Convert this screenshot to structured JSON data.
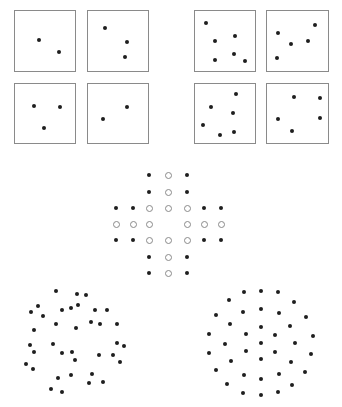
{
  "figure": {
    "colors": {
      "dot": "#1e1e1e",
      "box_border": "#8a8a8a",
      "open_circle_border": "#8a8a8a",
      "background": "#ffffff"
    },
    "boxes": [
      {
        "name": "box-top-left-1",
        "x": 14,
        "y": 10,
        "w": 62,
        "h": 62,
        "dots": [
          [
            39,
            40
          ],
          [
            59,
            52
          ]
        ]
      },
      {
        "name": "box-top-left-2",
        "x": 87,
        "y": 10,
        "w": 62,
        "h": 62,
        "dots": [
          [
            105,
            28
          ],
          [
            127,
            42
          ],
          [
            125,
            57
          ]
        ]
      },
      {
        "name": "box-top-left-3",
        "x": 14,
        "y": 83,
        "w": 62,
        "h": 61,
        "dots": [
          [
            34,
            106
          ],
          [
            60,
            107
          ],
          [
            44,
            128
          ]
        ]
      },
      {
        "name": "box-top-left-4",
        "x": 87,
        "y": 83,
        "w": 62,
        "h": 61,
        "dots": [
          [
            127,
            107
          ],
          [
            103,
            119
          ]
        ]
      },
      {
        "name": "box-top-right-1",
        "x": 194,
        "y": 10,
        "w": 62,
        "h": 62,
        "dots": [
          [
            206,
            23
          ],
          [
            215,
            41
          ],
          [
            235,
            36
          ],
          [
            215,
            60
          ],
          [
            234,
            54
          ],
          [
            245,
            61
          ]
        ]
      },
      {
        "name": "box-top-right-2",
        "x": 266,
        "y": 10,
        "w": 63,
        "h": 62,
        "dots": [
          [
            278,
            33
          ],
          [
            291,
            44
          ],
          [
            308,
            41
          ],
          [
            315,
            25
          ],
          [
            277,
            58
          ]
        ]
      },
      {
        "name": "box-top-right-3",
        "x": 194,
        "y": 83,
        "w": 62,
        "h": 61,
        "dots": [
          [
            236,
            94
          ],
          [
            211,
            107
          ],
          [
            233,
            113
          ],
          [
            203,
            125
          ],
          [
            220,
            135
          ],
          [
            234,
            132
          ]
        ]
      },
      {
        "name": "box-top-right-4",
        "x": 266,
        "y": 83,
        "w": 63,
        "h": 61,
        "dots": [
          [
            294,
            97
          ],
          [
            320,
            98
          ],
          [
            278,
            119
          ],
          [
            320,
            118
          ],
          [
            292,
            131
          ]
        ]
      }
    ],
    "grid": {
      "col_x": [
        116,
        133,
        149,
        168,
        187,
        204,
        221
      ],
      "row_y": [
        175,
        192,
        208,
        224,
        240,
        257,
        273
      ],
      "legend": {
        "f": "filled dot",
        "o": "open circle",
        "-": "empty"
      },
      "rows": [
        "--fof--",
        "--fof--",
        "ffooo ff",
        "ooo-ooo",
        "ffoooff",
        "--fof--",
        "--fof--"
      ]
    },
    "cluster_left": {
      "dots": [
        [
          56,
          291
        ],
        [
          77,
          294
        ],
        [
          86,
          295
        ],
        [
          38,
          306
        ],
        [
          31,
          312
        ],
        [
          62,
          310
        ],
        [
          71,
          308
        ],
        [
          78,
          305
        ],
        [
          95,
          310
        ],
        [
          107,
          310
        ],
        [
          43,
          316
        ],
        [
          56,
          324
        ],
        [
          76,
          328
        ],
        [
          91,
          322
        ],
        [
          100,
          324
        ],
        [
          117,
          324
        ],
        [
          34,
          330
        ],
        [
          30,
          345
        ],
        [
          53,
          344
        ],
        [
          117,
          343
        ],
        [
          124,
          346
        ],
        [
          34,
          352
        ],
        [
          62,
          353
        ],
        [
          72,
          352
        ],
        [
          75,
          360
        ],
        [
          99,
          355
        ],
        [
          113,
          355
        ],
        [
          120,
          362
        ],
        [
          26,
          364
        ],
        [
          33,
          369
        ],
        [
          71,
          375
        ],
        [
          92,
          374
        ],
        [
          58,
          378
        ],
        [
          89,
          383
        ],
        [
          103,
          382
        ],
        [
          51,
          389
        ],
        [
          62,
          392
        ]
      ]
    },
    "cluster_right": {
      "dots": [
        [
          244,
          292
        ],
        [
          261,
          291
        ],
        [
          278,
          292
        ],
        [
          229,
          300
        ],
        [
          294,
          302
        ],
        [
          243,
          312
        ],
        [
          261,
          309
        ],
        [
          279,
          313
        ],
        [
          216,
          315
        ],
        [
          306,
          317
        ],
        [
          230,
          324
        ],
        [
          261,
          327
        ],
        [
          290,
          326
        ],
        [
          209,
          334
        ],
        [
          246,
          334
        ],
        [
          275,
          335
        ],
        [
          313,
          336
        ],
        [
          225,
          344
        ],
        [
          261,
          343
        ],
        [
          295,
          343
        ],
        [
          209,
          353
        ],
        [
          246,
          351
        ],
        [
          275,
          352
        ],
        [
          311,
          354
        ],
        [
          231,
          361
        ],
        [
          261,
          359
        ],
        [
          291,
          362
        ],
        [
          216,
          370
        ],
        [
          305,
          372
        ],
        [
          244,
          375
        ],
        [
          279,
          374
        ],
        [
          261,
          379
        ],
        [
          227,
          384
        ],
        [
          292,
          385
        ],
        [
          243,
          393
        ],
        [
          261,
          395
        ],
        [
          278,
          392
        ]
      ]
    }
  }
}
